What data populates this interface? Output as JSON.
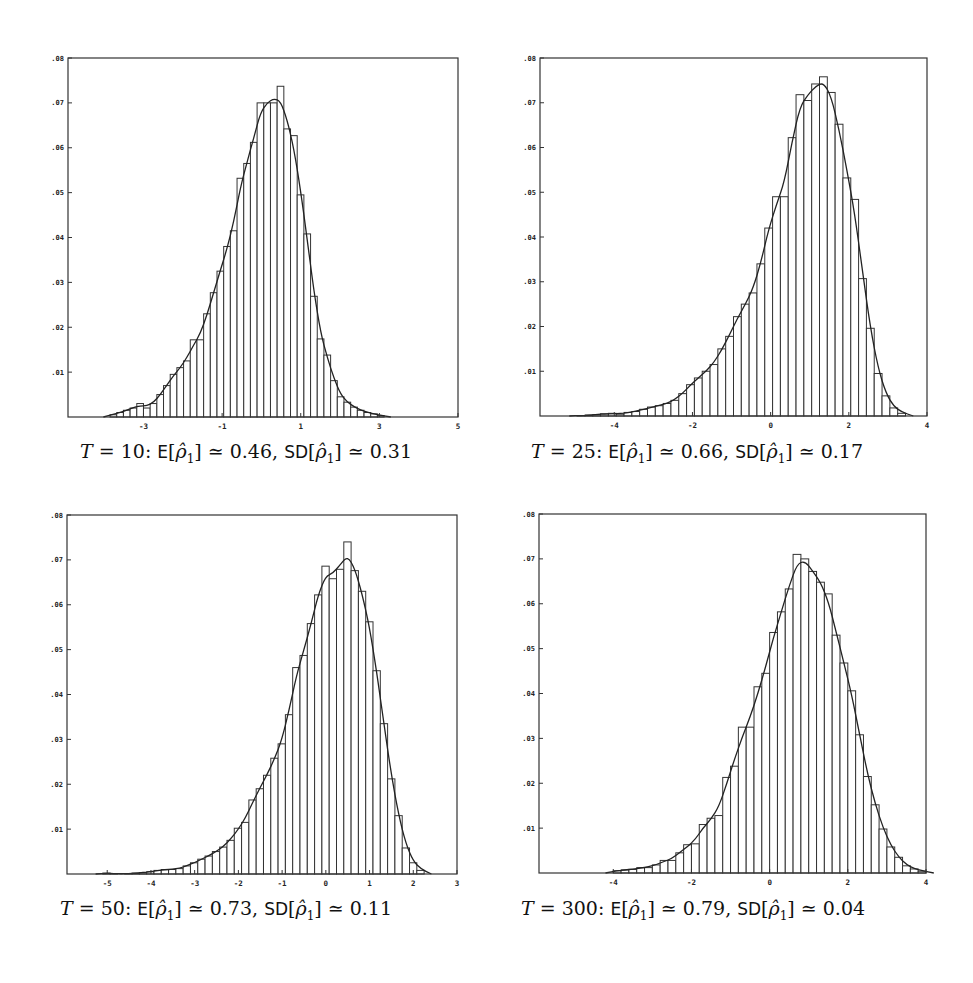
{
  "figure": {
    "panels": [
      {
        "id": "T10",
        "caption": {
          "T": "10",
          "E": "0.46",
          "SD": "0.31"
        },
        "box": {
          "left": 68,
          "top": 58,
          "right": 458,
          "bottom": 417
        },
        "xlim": [
          -4.92,
          5
        ],
        "ylim": [
          0,
          0.08
        ],
        "xticks": [
          -3,
          -1,
          1,
          3,
          5
        ],
        "xtick_labels": [
          "-3",
          "-1",
          "1",
          "3",
          "5"
        ],
        "yticks": [
          0.01,
          0.02,
          0.03,
          0.04,
          0.05,
          0.06,
          0.07,
          0.08
        ],
        "ytick_labels": [
          ".01",
          ".02",
          ".03",
          ".04",
          ".05",
          ".06",
          ".07",
          ".08"
        ]
      },
      {
        "id": "T25",
        "caption": {
          "T": "25",
          "E": "0.66",
          "SD": "0.17"
        },
        "box": {
          "left": 540,
          "top": 58,
          "right": 927,
          "bottom": 416
        },
        "xlim": [
          -5.9,
          4
        ],
        "ylim": [
          0,
          0.08
        ],
        "xticks": [
          -4,
          -2,
          0,
          2,
          4
        ],
        "xtick_labels": [
          "-4",
          "-2",
          "0",
          "2",
          "4"
        ],
        "yticks": [
          0.01,
          0.02,
          0.03,
          0.04,
          0.05,
          0.06,
          0.07,
          0.08
        ],
        "ytick_labels": [
          ".01",
          ".02",
          ".03",
          ".04",
          ".05",
          ".06",
          ".07",
          ".08"
        ]
      },
      {
        "id": "T50",
        "caption": {
          "T": "50",
          "E": "0.73",
          "SD": "0.11"
        },
        "box": {
          "left": 67,
          "top": 515,
          "right": 457,
          "bottom": 874
        },
        "xlim": [
          -5.92,
          3
        ],
        "ylim": [
          0,
          0.08
        ],
        "xticks": [
          -5,
          -4,
          -3,
          -2,
          -1,
          0,
          1,
          2,
          3
        ],
        "xtick_labels": [
          "-5",
          "-4",
          "-3",
          "-2",
          "-1",
          "0",
          "1",
          "2",
          "3"
        ],
        "yticks": [
          0.01,
          0.02,
          0.03,
          0.04,
          0.05,
          0.06,
          0.07,
          0.08
        ],
        "ytick_labels": [
          ".01",
          ".02",
          ".03",
          ".04",
          ".05",
          ".06",
          ".07",
          ".08"
        ]
      },
      {
        "id": "T300",
        "caption": {
          "T": "300",
          "E": "0.79",
          "SD": "0.04"
        },
        "box": {
          "left": 539,
          "top": 514,
          "right": 926,
          "bottom": 873
        },
        "xlim": [
          -5.9,
          4
        ],
        "ylim": [
          0,
          0.08
        ],
        "xticks": [
          -4,
          -2,
          0,
          2,
          4
        ],
        "xtick_labels": [
          "-4",
          "-2",
          "0",
          "2",
          "4"
        ],
        "yticks": [
          0.01,
          0.02,
          0.03,
          0.04,
          0.05,
          0.06,
          0.07,
          0.08
        ],
        "ytick_labels": [
          ".01",
          ".02",
          ".03",
          ".04",
          ".05",
          ".06",
          ".07",
          ".08"
        ]
      }
    ]
  },
  "chart_data": [
    {
      "type": "bar",
      "title": "T = 10: E[ρ̂1] ≃ 0.46, SD[ρ̂1] ≃ 0.31",
      "xlabel": "",
      "ylabel": "",
      "xlim": [
        -4.92,
        5
      ],
      "ylim": [
        0,
        0.08
      ],
      "grid": false,
      "legend": null,
      "bin_start": -3.85,
      "bin_width": 0.17,
      "values": [
        0.0005,
        0.001,
        0.0015,
        0.002,
        0.003,
        0.002,
        0.003,
        0.005,
        0.007,
        0.0095,
        0.011,
        0.0125,
        0.0172,
        0.0172,
        0.023,
        0.0277,
        0.0325,
        0.038,
        0.0415,
        0.0532,
        0.0565,
        0.0612,
        0.07,
        0.07,
        0.07,
        0.0737,
        0.0642,
        0.0627,
        0.0495,
        0.0408,
        0.0269,
        0.0174,
        0.0138,
        0.0081,
        0.0045,
        0.0033,
        0.0022,
        0.0015,
        0.001,
        0.0007,
        0.0003
      ],
      "curve": {
        "type": "density-fit",
        "peak_x": 0.42,
        "peak_y": 0.0701
      }
    },
    {
      "type": "bar",
      "title": "T = 25: E[ρ̂1] ≃ 0.66, SD[ρ̂1] ≃ 0.17",
      "xlabel": "",
      "ylabel": "",
      "xlim": [
        -5.9,
        4
      ],
      "ylim": [
        0,
        0.08
      ],
      "grid": false,
      "legend": null,
      "bin_start": -4.95,
      "bin_width": 0.2,
      "values": [
        0.0001,
        0.0002,
        0.0003,
        0.0005,
        0.0006,
        0.0004,
        0.0008,
        0.001,
        0.0015,
        0.002,
        0.0023,
        0.0028,
        0.0035,
        0.005,
        0.007,
        0.0085,
        0.01,
        0.0115,
        0.015,
        0.0178,
        0.0222,
        0.025,
        0.0275,
        0.034,
        0.042,
        0.049,
        0.049,
        0.0622,
        0.0718,
        0.0705,
        0.0742,
        0.0758,
        0.0723,
        0.0652,
        0.0532,
        0.0484,
        0.0307,
        0.0196,
        0.0095,
        0.0045,
        0.0018,
        0.0006
      ],
      "curve": {
        "type": "density-fit",
        "peak_x": 0.45,
        "peak_y": 0.0743
      }
    },
    {
      "type": "bar",
      "title": "T = 50: E[ρ̂1] ≃ 0.73, SD[ρ̂1] ≃ 0.11",
      "xlabel": "",
      "ylabel": "",
      "xlim": [
        -5.92,
        3
      ],
      "ylim": [
        0,
        0.08
      ],
      "grid": false,
      "legend": null,
      "bin_start": -5.1,
      "bin_width": 0.167,
      "values": [
        0.0002,
        0.0001,
        0.0,
        0.0001,
        0.0002,
        0.0003,
        0.0005,
        0.0008,
        0.001,
        0.001,
        0.0012,
        0.0018,
        0.0025,
        0.0033,
        0.004,
        0.005,
        0.006,
        0.0075,
        0.0102,
        0.0115,
        0.0165,
        0.019,
        0.022,
        0.0258,
        0.029,
        0.0355,
        0.046,
        0.0487,
        0.0558,
        0.0622,
        0.0686,
        0.0658,
        0.0679,
        0.074,
        0.0676,
        0.063,
        0.0562,
        0.0453,
        0.0335,
        0.0212,
        0.013,
        0.0058,
        0.0025,
        0.0008
      ],
      "curve": {
        "type": "density-fit",
        "peak_x": 0.5,
        "peak_y": 0.0693
      }
    },
    {
      "type": "bar",
      "title": "T = 300: E[ρ̂1] ≃ 0.79, SD[ρ̂1] ≃ 0.04",
      "xlabel": "",
      "ylabel": "",
      "xlim": [
        -5.9,
        4
      ],
      "ylim": [
        0,
        0.08
      ],
      "grid": false,
      "legend": null,
      "bin_start": -4.0,
      "bin_width": 0.2,
      "values": [
        0.0005,
        0.0007,
        0.0008,
        0.0012,
        0.0012,
        0.0018,
        0.0028,
        0.0028,
        0.0045,
        0.0063,
        0.0065,
        0.0108,
        0.0122,
        0.0128,
        0.0213,
        0.0238,
        0.0325,
        0.0325,
        0.0415,
        0.0445,
        0.0536,
        0.0582,
        0.0633,
        0.071,
        0.07,
        0.0672,
        0.0648,
        0.0622,
        0.053,
        0.0468,
        0.0406,
        0.0308,
        0.0215,
        0.0152,
        0.0098,
        0.0058,
        0.0035,
        0.0016,
        0.0009,
        0.0004
      ],
      "curve": {
        "type": "density-fit",
        "peak_x": 0.2,
        "peak_y": 0.0683
      }
    }
  ]
}
